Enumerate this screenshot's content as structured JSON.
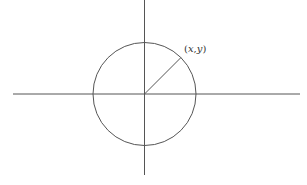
{
  "diagram": {
    "point_label": "(x,y)",
    "top_fragment": "",
    "axes": {
      "horizontal": {
        "x1": 13,
        "x2": 300,
        "y": 94
      },
      "vertical": {
        "x": 144.5,
        "y1": 0,
        "y2": 175
      }
    },
    "circle": {
      "cx": 144.5,
      "cy": 94,
      "r": 51.5
    },
    "radius_line": {
      "x1": 144.5,
      "y1": 94,
      "x2": 181,
      "y2": 57.5,
      "angle_deg": 45
    },
    "colors": {
      "stroke": "#555555",
      "text": "#333333",
      "background": "#ffffff"
    }
  }
}
